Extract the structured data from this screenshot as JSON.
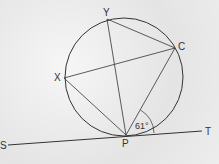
{
  "diagram": {
    "type": "circle-geometry",
    "points": {
      "Y": {
        "label": "Y",
        "x": 107,
        "y": 19
      },
      "C": {
        "label": "C",
        "x": 175,
        "y": 48
      },
      "X": {
        "label": "X",
        "x": 64,
        "y": 78
      },
      "P": {
        "label": "P",
        "x": 126,
        "y": 135
      },
      "S": {
        "label": "S"
      },
      "T": {
        "label": "T"
      }
    },
    "angle_label": "61°",
    "colors": {
      "line": "#333333",
      "background": "#ececec"
    }
  }
}
